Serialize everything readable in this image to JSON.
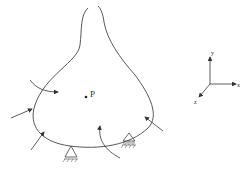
{
  "diagram": {
    "point_label": "P",
    "axes": {
      "x": "x",
      "y": "y",
      "z": "z"
    },
    "elements": [
      "deformable-body",
      "external-force-arrows",
      "moment-arrows",
      "pin-support",
      "roller-support",
      "point-P",
      "coordinate-axes"
    ]
  }
}
